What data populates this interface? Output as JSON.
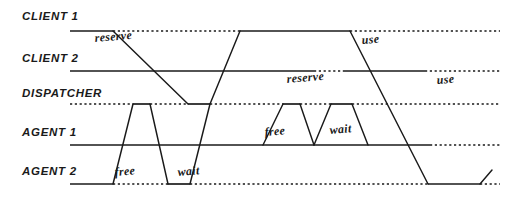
{
  "diagram": {
    "type": "timing-diagram",
    "width": 517,
    "height": 203,
    "background_color": "#ffffff",
    "ink_color": "#1a1a1a",
    "style": "hand-drawn sketch, italic handwriting labels",
    "lanes": [
      {
        "id": "client1",
        "label": "CLIENT 1",
        "label_x": 22,
        "label_y": 20,
        "baseline_y": 31,
        "line_start_x": 70
      },
      {
        "id": "client2",
        "label": "CLIENT 2",
        "label_x": 22,
        "label_y": 62,
        "baseline_y": 71,
        "line_start_x": 70
      },
      {
        "id": "dispatcher",
        "label": "DISPATCHER",
        "label_x": 22,
        "label_y": 97,
        "baseline_y": 104,
        "line_start_x": 70
      },
      {
        "id": "agent1",
        "label": "AGENT 1",
        "label_x": 22,
        "label_y": 136,
        "baseline_y": 145,
        "line_start_x": 70
      },
      {
        "id": "agent2",
        "label": "AGENT 2",
        "label_x": 22,
        "label_y": 175,
        "baseline_y": 184,
        "line_start_x": 70
      }
    ],
    "event_labels": [
      {
        "text": "reserve",
        "x": 95,
        "y": 42,
        "rotate": -5,
        "lane": "client1"
      },
      {
        "text": "use",
        "x": 362,
        "y": 44,
        "rotate": -5,
        "lane": "client1"
      },
      {
        "text": "reserve",
        "x": 287,
        "y": 83,
        "rotate": -5,
        "lane": "client2"
      },
      {
        "text": "use",
        "x": 437,
        "y": 84,
        "rotate": -5,
        "lane": "client2"
      },
      {
        "text": "free",
        "x": 265,
        "y": 136,
        "rotate": -5,
        "lane": "agent1"
      },
      {
        "text": "wait",
        "x": 330,
        "y": 134,
        "rotate": -5,
        "lane": "agent1"
      },
      {
        "text": "free",
        "x": 115,
        "y": 176,
        "rotate": -5,
        "lane": "agent2"
      },
      {
        "text": "wait",
        "x": 178,
        "y": 176,
        "rotate": -5,
        "lane": "agent2"
      }
    ],
    "state_segments": [
      {
        "lane": "client1",
        "style": "solid",
        "x1": 70,
        "x2": 113,
        "y": 31
      },
      {
        "lane": "client1",
        "style": "dotted",
        "x1": 113,
        "x2": 240,
        "y": 31
      },
      {
        "lane": "client1",
        "style": "solid",
        "x1": 240,
        "x2": 350,
        "y": 31
      },
      {
        "lane": "client1",
        "style": "dotted",
        "x1": 350,
        "x2": 500,
        "y": 31
      },
      {
        "lane": "client2",
        "style": "solid",
        "x1": 70,
        "x2": 314,
        "y": 71
      },
      {
        "lane": "client2",
        "style": "dotted",
        "x1": 314,
        "x2": 345,
        "y": 71
      },
      {
        "lane": "client2",
        "style": "solid",
        "x1": 345,
        "x2": 425,
        "y": 71
      },
      {
        "lane": "client2",
        "style": "dotted",
        "x1": 425,
        "x2": 500,
        "y": 71
      },
      {
        "lane": "dispatcher",
        "style": "dotted",
        "x1": 70,
        "x2": 133,
        "y": 104
      },
      {
        "lane": "dispatcher",
        "style": "solid",
        "x1": 133,
        "x2": 150,
        "y": 104
      },
      {
        "lane": "dispatcher",
        "style": "dotted",
        "x1": 150,
        "x2": 188,
        "y": 104
      },
      {
        "lane": "dispatcher",
        "style": "solid",
        "x1": 188,
        "x2": 210,
        "y": 104
      },
      {
        "lane": "dispatcher",
        "style": "dotted",
        "x1": 210,
        "x2": 283,
        "y": 104
      },
      {
        "lane": "dispatcher",
        "style": "solid",
        "x1": 283,
        "x2": 300,
        "y": 104
      },
      {
        "lane": "dispatcher",
        "style": "dotted",
        "x1": 300,
        "x2": 331,
        "y": 104
      },
      {
        "lane": "dispatcher",
        "style": "solid",
        "x1": 331,
        "x2": 352,
        "y": 104
      },
      {
        "lane": "dispatcher",
        "style": "dotted",
        "x1": 352,
        "x2": 500,
        "y": 104
      },
      {
        "lane": "agent1",
        "style": "solid",
        "x1": 70,
        "x2": 430,
        "y": 145
      },
      {
        "lane": "agent1",
        "style": "dotted",
        "x1": 430,
        "x2": 500,
        "y": 145
      },
      {
        "lane": "agent2",
        "style": "solid",
        "x1": 70,
        "x2": 113,
        "y": 184
      },
      {
        "lane": "agent2",
        "style": "dotted",
        "x1": 113,
        "x2": 168,
        "y": 184
      },
      {
        "lane": "agent2",
        "style": "solid",
        "x1": 168,
        "x2": 190,
        "y": 184
      },
      {
        "lane": "agent2",
        "style": "dotted",
        "x1": 190,
        "x2": 428,
        "y": 184
      },
      {
        "lane": "agent2",
        "style": "solid",
        "x1": 428,
        "x2": 480,
        "y": 184
      },
      {
        "lane": "agent2",
        "style": "dotted",
        "x1": 480,
        "x2": 500,
        "y": 184
      }
    ],
    "transitions": [
      {
        "id": "t-reserve-c1-to-disp",
        "points": "113,31 188,104"
      },
      {
        "id": "t-disp-rise-to-c2",
        "points": "210,104 240,31"
      },
      {
        "id": "t-a2-free-up",
        "points": "113,184 133,104"
      },
      {
        "id": "t-a2-free-down",
        "points": "150,104 168,184"
      },
      {
        "id": "t-a2-wait-up",
        "points": "190,184 210,104"
      },
      {
        "id": "t-a1-free-up",
        "points": "263,145 283,104"
      },
      {
        "id": "t-a1-free-down",
        "points": "300,104 314,145"
      },
      {
        "id": "t-a1-wait-up",
        "points": "314,145 331,104"
      },
      {
        "id": "t-a1-wait-down",
        "points": "352,104 368,145"
      },
      {
        "id": "t-use-c1-down",
        "points": "350,31 428,184"
      },
      {
        "id": "t-a2-final-up",
        "points": "480,184 492,170"
      }
    ]
  }
}
